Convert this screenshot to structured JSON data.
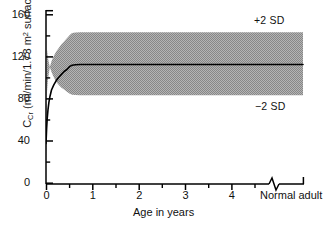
{
  "chart_data": {
    "type": "area",
    "title": "",
    "subtitle": "",
    "xlabel": "Age in years",
    "ylabel_parts": {
      "symbol": "C",
      "symbol_sub": "Cr",
      "units_pre": " (ml/min/1.73 m",
      "units_sup": "2",
      "units_post": " surface area)"
    },
    "ylabel_plain": "CCr (ml/min/1.73 m2 surface area)",
    "xlim": [
      0,
      5.35
    ],
    "ylim": [
      0,
      160
    ],
    "grid": false,
    "legend_position": "inline-right",
    "x_major_ticks": [
      0,
      1,
      2,
      3,
      4
    ],
    "x_major_tick_labels": [
      "0",
      "1",
      "2",
      "3",
      "4"
    ],
    "x_minor_ticks": [
      0.5,
      1.5,
      2.5,
      3.5,
      4.5
    ],
    "y_major_ticks": [
      0,
      40,
      80,
      120,
      160
    ],
    "y_major_tick_labels": [
      "0",
      "40",
      "80",
      "120",
      "160"
    ],
    "y_minor_ticks": [
      20,
      60,
      100,
      140
    ],
    "axis_break": {
      "present": true,
      "x_position": 4.78,
      "style": "zigzag",
      "right_category_label": "Normal adult",
      "right_category_x": 5.2
    },
    "annotations": [
      {
        "id": "upper-sd",
        "text": "+2 SD",
        "x": 4.25,
        "y": 152
      },
      {
        "id": "lower-sd",
        "text": "−2 SD",
        "x": 4.25,
        "y": 70
      }
    ],
    "series": [
      {
        "name": "Mean CCr",
        "type": "line",
        "color": "#000000",
        "x": [
          0.0,
          0.05,
          0.1,
          0.17,
          0.25,
          0.35,
          0.5,
          0.7,
          0.9,
          1.1,
          1.35,
          1.6,
          1.85,
          2.1,
          2.3,
          2.6,
          3.0,
          3.5,
          4.0,
          4.5,
          4.78,
          5.35
        ],
        "values": [
          38,
          52,
          62,
          71,
          78,
          84,
          90,
          95,
          99,
          102,
          105,
          108,
          110,
          113,
          114,
          114,
          114,
          114,
          114,
          114,
          114,
          114
        ]
      },
      {
        "name": "+2 SD",
        "type": "band-upper",
        "color": "#9b9b9b",
        "x": [
          0.0,
          0.05,
          0.1,
          0.17,
          0.25,
          0.35,
          0.5,
          0.7,
          0.9,
          1.1,
          1.35,
          1.6,
          1.85,
          2.1,
          2.3,
          2.6,
          3.0,
          3.5,
          4.0,
          4.5,
          4.78,
          5.35
        ],
        "values": [
          56,
          76,
          88,
          98,
          105,
          112,
          118,
          123,
          127,
          130,
          134,
          137,
          140,
          143,
          145,
          145,
          145,
          145,
          145,
          145,
          145,
          145
        ]
      },
      {
        "name": "−2 SD",
        "type": "band-lower",
        "color": "#9b9b9b",
        "x": [
          0.0,
          0.05,
          0.1,
          0.17,
          0.25,
          0.35,
          0.5,
          0.7,
          0.9,
          1.1,
          1.35,
          1.6,
          1.85,
          2.1,
          2.3,
          2.6,
          3.0,
          3.5,
          4.0,
          4.5,
          4.78,
          5.35
        ],
        "values": [
          21,
          32,
          40,
          47,
          52,
          57,
          62,
          66,
          69,
          71,
          74,
          76,
          78,
          80,
          81,
          81,
          81,
          81,
          81,
          81,
          81,
          81
        ]
      }
    ],
    "band_fill_color": "#9e9e9e",
    "line_color": "#000000",
    "axis_color": "#000000",
    "background_color": "#ffffff"
  },
  "axes": {
    "y_labels": [
      "160",
      "120",
      "80",
      "40",
      "0"
    ],
    "x_labels": [
      "0",
      "1",
      "2",
      "3",
      "4"
    ],
    "x_title": "Age in years",
    "normal_adult": "Normal adult"
  },
  "labels": {
    "plus_2_sd": "+2 SD",
    "minus_2_sd": "−2 SD"
  }
}
